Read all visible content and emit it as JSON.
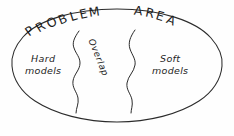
{
  "diagram": {
    "title_words": [
      "PROBLEM",
      "AREA"
    ],
    "style": "hand-drawn sketch",
    "shape": "ellipse",
    "stroke_color": "#2b2b2b",
    "background_color": "#fefefe",
    "title_letters": [
      {
        "ch": "P",
        "x": 30,
        "y": 34,
        "rot": -36
      },
      {
        "ch": "R",
        "x": 39,
        "y": 30,
        "rot": -32
      },
      {
        "ch": "O",
        "x": 49,
        "y": 26,
        "rot": -28
      },
      {
        "ch": "B",
        "x": 60,
        "y": 23,
        "rot": -23
      },
      {
        "ch": "L",
        "x": 70,
        "y": 20,
        "rot": -18
      },
      {
        "ch": "E",
        "x": 79,
        "y": 18,
        "rot": -14
      },
      {
        "ch": "M",
        "x": 89,
        "y": 16,
        "rot": -10
      },
      {
        "ch": "A",
        "x": 132,
        "y": 15,
        "rot": 6
      },
      {
        "ch": "R",
        "x": 143,
        "y": 16,
        "rot": 11
      },
      {
        "ch": "E",
        "x": 153,
        "y": 19,
        "rot": 16
      },
      {
        "ch": "A",
        "x": 163,
        "y": 22,
        "rot": 22
      }
    ],
    "regions": [
      {
        "id": "hard",
        "label_line1": "Hard",
        "label_line2": "models",
        "position": "left"
      },
      {
        "id": "overlap",
        "label_line1": "Overlap",
        "label_line2": "",
        "position": "center",
        "rotation_deg": 68
      },
      {
        "id": "soft",
        "label_line1": "Soft",
        "label_line2": "models",
        "position": "right"
      }
    ],
    "ellipse": {
      "center_x": 117,
      "center_y": 66,
      "radius_x": 106,
      "radius_y": 57
    },
    "dividers": [
      {
        "id": "left-wavy-divider",
        "top_x": 78,
        "top_y": 31,
        "bottom_x": 76,
        "bottom_y": 113
      },
      {
        "id": "right-wavy-divider",
        "top_x": 134,
        "top_y": 30,
        "bottom_x": 131,
        "bottom_y": 113
      }
    ]
  }
}
